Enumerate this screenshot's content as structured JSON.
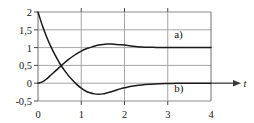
{
  "figure": {
    "background_color": "#ffffff",
    "frame_color": "#6e6e6e",
    "grid_color": "#9a9a9a",
    "curve_color": "#1a1a1a",
    "axis_arrow_color": "#4a4a4a"
  },
  "chart_data": {
    "type": "line",
    "title": "",
    "xlabel": "t",
    "ylabel": "",
    "xlim": [
      0,
      4
    ],
    "ylim": [
      -0.5,
      2
    ],
    "grid": true,
    "legend_position": "inline-right",
    "x_ticks": [
      0,
      1,
      2,
      3,
      4
    ],
    "x_tick_labels": [
      "0",
      "1",
      "2",
      "3",
      "4"
    ],
    "y_ticks": [
      -0.5,
      0,
      0.5,
      1,
      1.5,
      2
    ],
    "y_tick_labels": [
      "-0,5",
      "0",
      "0,5",
      "1",
      "1,5",
      "2"
    ],
    "series": [
      {
        "name": "a)",
        "label": "a)",
        "label_x": 3.15,
        "label_y": 1.28,
        "x": [
          0,
          0.1,
          0.2,
          0.3,
          0.4,
          0.5,
          0.6,
          0.7,
          0.8,
          0.9,
          1.0,
          1.1,
          1.2,
          1.3,
          1.4,
          1.5,
          1.6,
          1.7,
          1.8,
          1.9,
          2.0,
          2.2,
          2.4,
          2.6,
          2.8,
          3.0,
          3.2,
          3.4,
          3.6,
          3.8,
          4.0
        ],
        "y": [
          0,
          0.035,
          0.12,
          0.23,
          0.34,
          0.45,
          0.56,
          0.66,
          0.75,
          0.83,
          0.9,
          0.96,
          1.0,
          1.04,
          1.07,
          1.09,
          1.1,
          1.1,
          1.09,
          1.08,
          1.07,
          1.04,
          1.02,
          1.01,
          1.0,
          1.0,
          1.0,
          1.0,
          1.0,
          1.0,
          1.0
        ]
      },
      {
        "name": "b)",
        "label": "b)",
        "label_x": 3.15,
        "label_y": -0.24,
        "x": [
          0,
          0.1,
          0.2,
          0.3,
          0.4,
          0.5,
          0.6,
          0.7,
          0.8,
          0.9,
          1.0,
          1.1,
          1.2,
          1.3,
          1.4,
          1.5,
          1.6,
          1.7,
          1.8,
          1.9,
          2.0,
          2.2,
          2.4,
          2.6,
          2.8,
          3.0,
          3.2,
          3.4,
          3.6,
          3.8,
          4.0
        ],
        "y": [
          2.0,
          1.62,
          1.3,
          1.02,
          0.78,
          0.56,
          0.38,
          0.22,
          0.08,
          -0.04,
          -0.14,
          -0.22,
          -0.27,
          -0.3,
          -0.31,
          -0.3,
          -0.27,
          -0.24,
          -0.2,
          -0.16,
          -0.13,
          -0.08,
          -0.05,
          -0.03,
          -0.015,
          -0.008,
          -0.004,
          -0.002,
          -0.001,
          0.0,
          0.0
        ]
      }
    ],
    "annotations": [
      {
        "name": "t-axis-arrow",
        "text": "t"
      }
    ]
  }
}
